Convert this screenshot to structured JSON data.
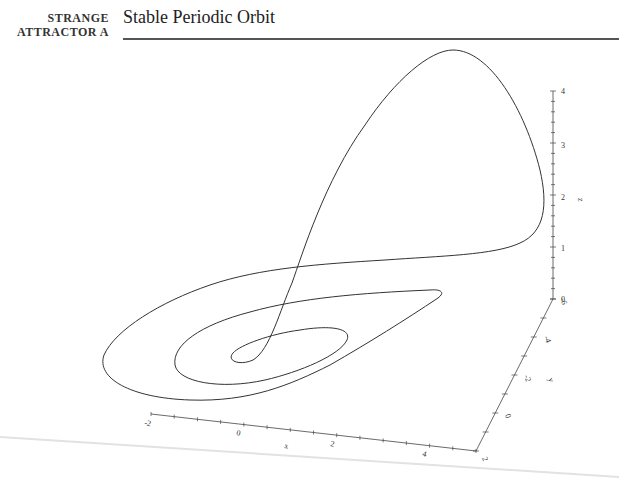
{
  "header": {
    "section_line1": "STRANGE",
    "section_line2": "ATTRACTOR A",
    "title": "Stable Periodic Orbit"
  },
  "colors": {
    "curve": "#333333",
    "axis": "#444444",
    "rule": "#555555",
    "page_edge": "#dddddd"
  },
  "chart_data": {
    "type": "line3d",
    "title": "Stable Periodic Orbit",
    "axes": {
      "x": {
        "label": "x",
        "ticks": [
          "-2",
          "0",
          "2",
          "4"
        ],
        "range": [
          -2,
          4.5
        ]
      },
      "y": {
        "label": "y",
        "ticks": [
          "2",
          "0",
          "-2",
          "-4",
          "-6"
        ],
        "range": [
          -6,
          2
        ]
      },
      "z": {
        "label": "z",
        "ticks": [
          "0",
          "1",
          "2",
          "3",
          "4"
        ],
        "range": [
          0,
          4
        ]
      }
    },
    "grid": false,
    "legend": null
  },
  "axis_labels": {
    "x": {
      "title": "x",
      "ticks": [
        "-2",
        "0",
        "2",
        "4"
      ]
    },
    "y": {
      "title": "y",
      "ticks": [
        "2",
        "0",
        "-2",
        "-4",
        "-6"
      ]
    },
    "z": {
      "title": "z",
      "ticks": [
        "0",
        "1",
        "2",
        "3",
        "4"
      ]
    }
  }
}
